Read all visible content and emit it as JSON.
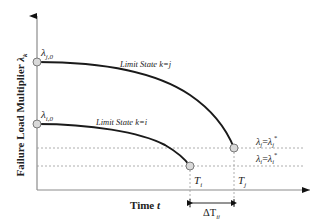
{
  "diagram": {
    "y_axis_label": "Failure Load Multiplier ",
    "y_axis_symbol": "λ",
    "y_axis_subscript": "k",
    "x_axis_label": "Time ",
    "x_axis_symbol": "t",
    "curves": [
      {
        "id": "j",
        "label": "Limit State k=j",
        "start_label_symbol": "λ",
        "start_label_subscript": "j,0",
        "end_time_symbol": "T",
        "end_time_subscript": "j",
        "threshold_label": "λj=λj*",
        "threshold_left": "λ",
        "threshold_left_sub": "j",
        "threshold_eq": "=",
        "threshold_right": "λ",
        "threshold_right_sub": "j",
        "threshold_right_sup": "*"
      },
      {
        "id": "i",
        "label": "Limit State k=i",
        "start_label_symbol": "λ",
        "start_label_subscript": "i,0",
        "end_time_symbol": "T",
        "end_time_subscript": "i",
        "threshold_label": "λi=λi*",
        "threshold_left": "λ",
        "threshold_left_sub": "i",
        "threshold_eq": "=",
        "threshold_right": "λ",
        "threshold_right_sub": "i",
        "threshold_right_sup": "*"
      }
    ],
    "interval_label_symbol": "ΔT",
    "interval_label_subscript": "ij",
    "colors": {
      "curve": "#1a1a1a",
      "axis": "#8c8c8c",
      "dashed": "#9a9a9a",
      "marker_fill": "#d9d9d9",
      "marker_stroke": "#7a7a7a",
      "text": "#222222"
    }
  }
}
